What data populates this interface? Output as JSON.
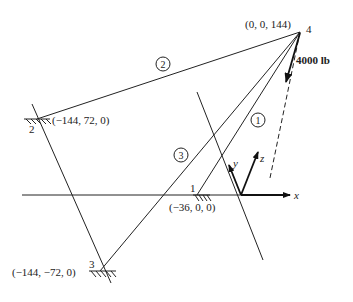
{
  "diagram": {
    "type": "3d-truss-free-body",
    "nodes": [
      {
        "id": "4",
        "label": "4",
        "coords": "(0, 0, 144)"
      },
      {
        "id": "2",
        "label": "2",
        "coords": "(−144, 72, 0)"
      },
      {
        "id": "1",
        "label": "1",
        "coords": "(−36, 0, 0)"
      },
      {
        "id": "3",
        "label": "3",
        "coords": "(−144, −72, 0)"
      }
    ],
    "members": [
      {
        "id": "1",
        "label": "1",
        "from": "4",
        "to": "1"
      },
      {
        "id": "2",
        "label": "2",
        "from": "4",
        "to": "2"
      },
      {
        "id": "3",
        "label": "3",
        "from": "4",
        "to": "3"
      }
    ],
    "load": {
      "label": "4000 lb",
      "at": "4",
      "direction": "downward"
    },
    "axes": {
      "x": "x",
      "y": "y",
      "z": "z"
    }
  }
}
